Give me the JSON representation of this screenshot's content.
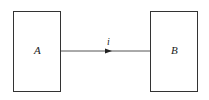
{
  "diagram": {
    "nodes": [
      {
        "id": "A",
        "label": "A"
      },
      {
        "id": "B",
        "label": "B"
      }
    ],
    "edges": [
      {
        "from": "A",
        "to": "B",
        "label": "i",
        "direction": "A-to-B"
      }
    ],
    "colors": {
      "stroke": "#333333",
      "background": "#ffffff"
    }
  }
}
